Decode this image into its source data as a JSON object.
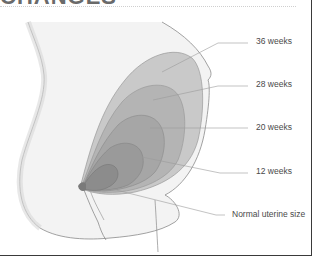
{
  "heading": "CHANGES",
  "diagram": {
    "labels": [
      {
        "id": "36w",
        "text": "36 weeks"
      },
      {
        "id": "28w",
        "text": "28 weeks"
      },
      {
        "id": "20w",
        "text": "20 weeks"
      },
      {
        "id": "12w",
        "text": "12 weeks"
      },
      {
        "id": "normal",
        "text": "Normal uterine size"
      }
    ],
    "colors": {
      "outline": "#8a8a8a",
      "layer_36": "#c9c9c9",
      "layer_28": "#b4b4b4",
      "layer_20": "#a6a6a6",
      "layer_12": "#9a9a9a",
      "layer_normal": "#8c8c8c",
      "leader": "#9a9a9a",
      "frame": "#3a3a3a"
    }
  }
}
